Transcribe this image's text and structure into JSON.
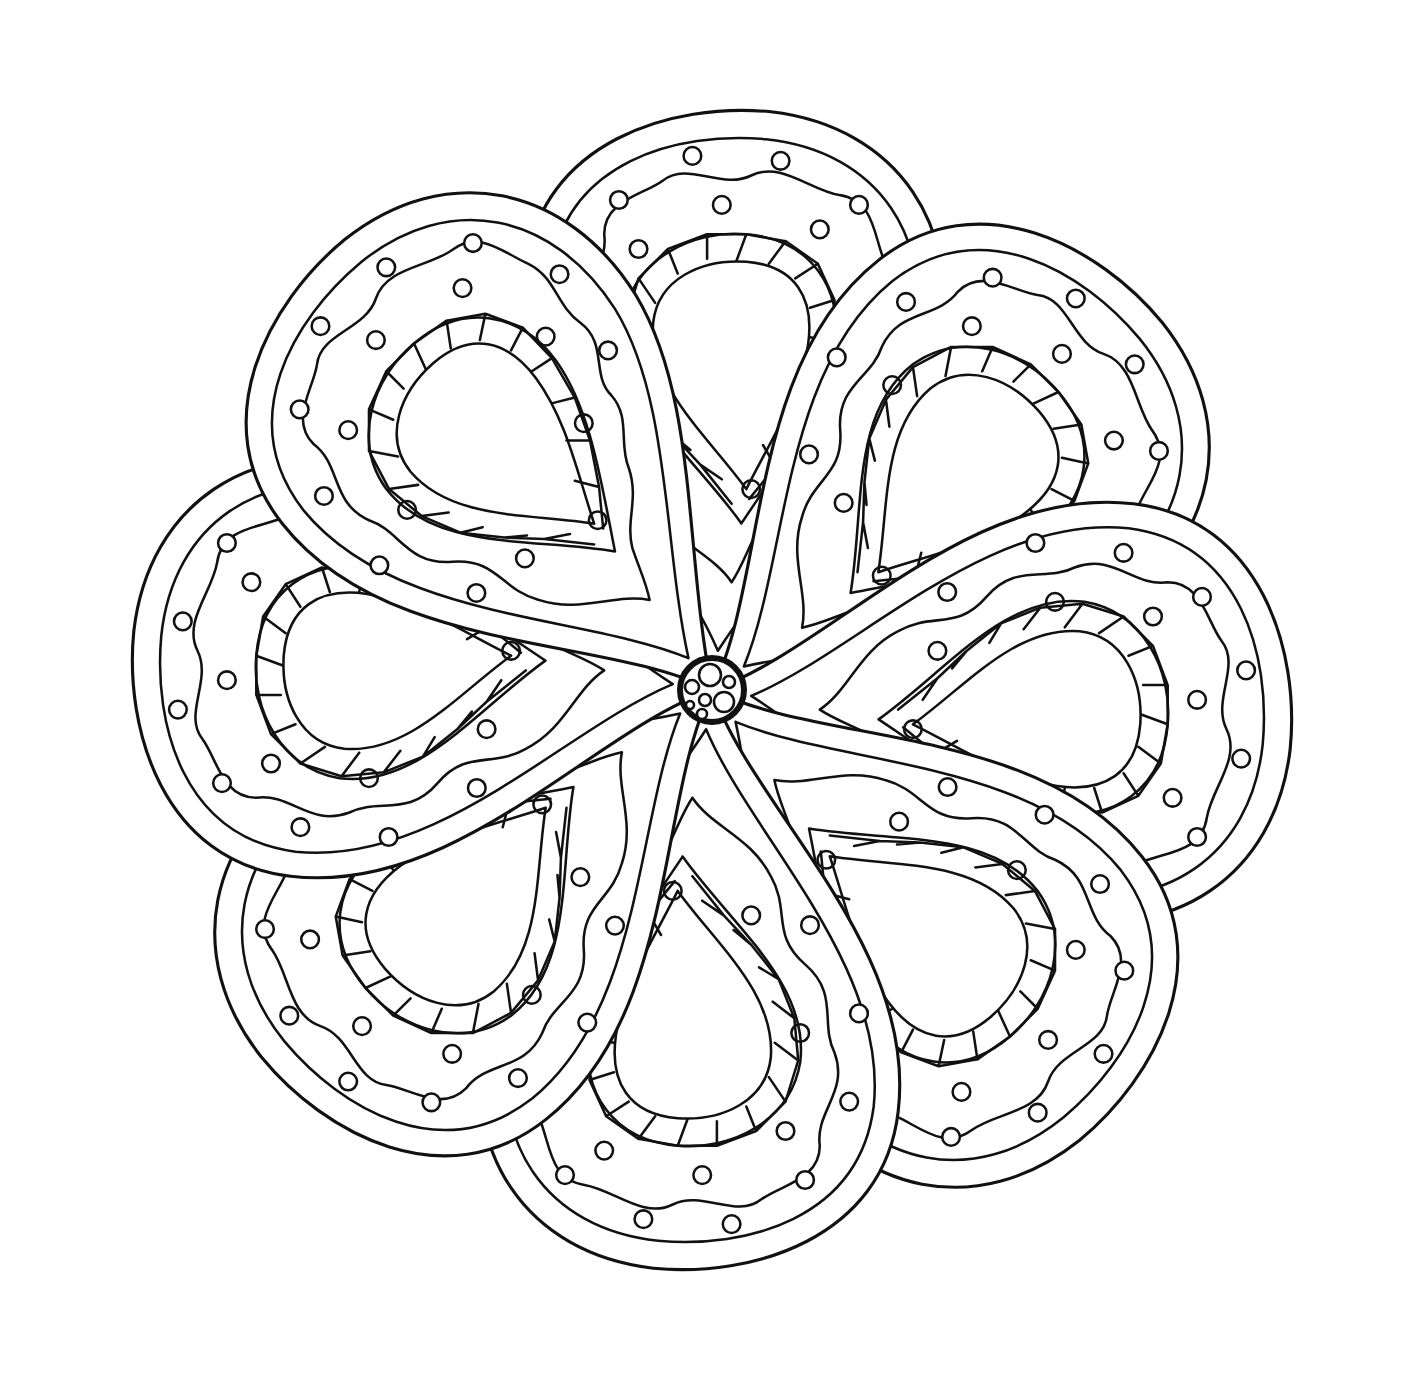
{
  "artwork": {
    "type": "line-art mandala coloring page",
    "background_color": "#ffffff",
    "ink_color": "#111111",
    "center": {
      "x": 712,
      "y": 690
    },
    "petal_count": 8,
    "arrangement": "pinwheel, each petal overlapping the next",
    "petal_layers": [
      "outer outline",
      "inner parallel outline",
      "wavy line with small circles along both sides",
      "band of alternating triangles",
      "empty teardrop core"
    ],
    "center_boss": "small ring filled with clustered circles",
    "visible_text": []
  }
}
